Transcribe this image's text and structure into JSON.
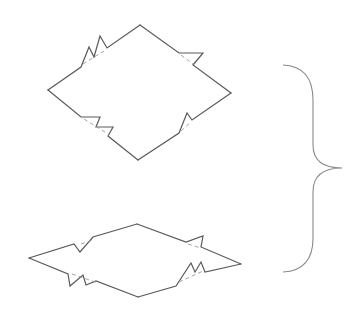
{
  "diagram": {
    "type": "broken-edge rhombus figures with grouping brace",
    "colors": {
      "stroke": "#5a5a5a",
      "dash": "#9a9a9a",
      "brace": "#8a8a8a",
      "background": "#ffffff"
    },
    "shapes": [
      {
        "name": "upper-rhombus",
        "vertices": {
          "top": [
            140,
            25
          ],
          "right": [
            231,
            93
          ],
          "bottom": [
            138,
            160
          ],
          "left": [
            48,
            90
          ]
        },
        "breaks": [
          {
            "edge": "top-left",
            "style": "double-zigzag"
          },
          {
            "edge": "top-right",
            "style": "single-zigzag"
          },
          {
            "edge": "bottom-left",
            "style": "double-zigzag"
          },
          {
            "edge": "bottom-right",
            "style": "single-zigzag"
          }
        ]
      },
      {
        "name": "lower-rhombus",
        "vertices": {
          "top": [
            137,
            224
          ],
          "right": [
            241,
            264
          ],
          "bottom": [
            138,
            297
          ],
          "left": [
            29,
            258
          ]
        },
        "breaks": [
          {
            "edge": "top-left",
            "style": "single-zigzag"
          },
          {
            "edge": "top-right",
            "style": "single-zigzag"
          },
          {
            "edge": "bottom-left",
            "style": "double-zigzag"
          },
          {
            "edge": "bottom-right",
            "style": "double-zigzag"
          }
        ]
      }
    ],
    "brace": {
      "side": "right",
      "x": 283,
      "top": 65,
      "bottom": 272,
      "tip_x": 342,
      "tip_y": 168
    }
  }
}
